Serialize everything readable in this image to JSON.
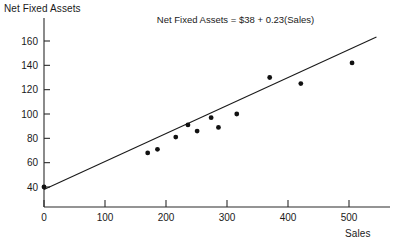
{
  "chart_data": {
    "type": "scatter",
    "title": "",
    "xlabel": "Sales",
    "ylabel": "Net Fixed Assets",
    "xlim": [
      0,
      560
    ],
    "ylim": [
      28,
      172
    ],
    "grid": false,
    "legend": "none",
    "xticks": [
      0,
      100,
      200,
      300,
      400,
      500
    ],
    "xticklabels": [
      "0",
      "100",
      "200",
      "300",
      "400",
      "500"
    ],
    "yticks": [
      40,
      60,
      80,
      100,
      120,
      140,
      160
    ],
    "yticklabels": [
      "40",
      "60",
      "80",
      "100",
      "120",
      "140",
      "160"
    ],
    "points": [
      {
        "x": 0,
        "y": 40
      },
      {
        "x": 170,
        "y": 68
      },
      {
        "x": 186,
        "y": 71
      },
      {
        "x": 216,
        "y": 81
      },
      {
        "x": 236,
        "y": 91
      },
      {
        "x": 251,
        "y": 86
      },
      {
        "x": 274,
        "y": 97
      },
      {
        "x": 286,
        "y": 89
      },
      {
        "x": 316,
        "y": 100
      },
      {
        "x": 370,
        "y": 130
      },
      {
        "x": 421,
        "y": 125
      },
      {
        "x": 505,
        "y": 142
      }
    ],
    "fit_line": {
      "intercept": 38,
      "slope": 0.23,
      "x_start": 0,
      "x_end": 545,
      "annotation": "Net Fixed Assets = $38 + 0.23(Sales)"
    },
    "annotations": [
      {
        "text": "Net Fixed Assets = $38 + 0.23(Sales)",
        "x": 185,
        "y": 175
      }
    ],
    "colors": {
      "point": "#111111",
      "line": "#1a1a1a",
      "axis": "#2b2b2b",
      "background": "#ffffff",
      "text": "#1a1a1a"
    }
  },
  "axes": {
    "y_title": "Net Fixed Assets",
    "x_title": "Sales"
  }
}
